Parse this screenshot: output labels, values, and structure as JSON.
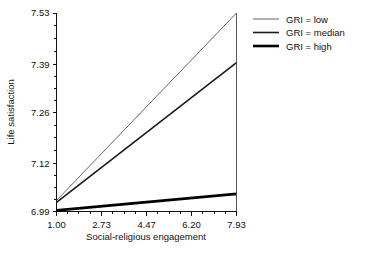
{
  "chart_data": {
    "type": "line",
    "title": "",
    "xlabel": "Social-religious engagement",
    "ylabel": "Life satisfaction",
    "xlim": [
      1.0,
      7.93
    ],
    "ylim": [
      6.99,
      7.53
    ],
    "xticks": [
      "1.00",
      "2.73",
      "4.47",
      "6.20",
      "7.93"
    ],
    "xtick_values": [
      1.0,
      2.73,
      4.47,
      6.2,
      7.93
    ],
    "yticks": [
      "6.99",
      "7.12",
      "7.26",
      "7.39",
      "7.53"
    ],
    "ytick_values": [
      6.99,
      7.12,
      7.26,
      7.39,
      7.53
    ],
    "grid": false,
    "legend_position": "right-top",
    "x": [
      1.0,
      7.93
    ],
    "series": [
      {
        "name": "GRI = low",
        "values": [
          7.02,
          7.53
        ],
        "color": "#555555",
        "linewidth": 0.9
      },
      {
        "name": "GRI = median",
        "values": [
          7.015,
          7.395
        ],
        "color": "#1a1a1a",
        "linewidth": 1.6
      },
      {
        "name": "GRI = high",
        "values": [
          6.993,
          7.038
        ],
        "color": "#000000",
        "linewidth": 2.6
      }
    ]
  },
  "legend": {
    "items": [
      {
        "label": "GRI = low"
      },
      {
        "label": "GRI = median"
      },
      {
        "label": "GRI = high"
      }
    ]
  },
  "axes": {
    "x_title": "Social-religious engagement",
    "y_title": "Life satisfaction",
    "x_tick_labels": [
      "1.00",
      "2.73",
      "4.47",
      "6.20",
      "7.93"
    ],
    "y_tick_labels": [
      "6.99",
      "7.12",
      "7.26",
      "7.39",
      "7.53"
    ]
  }
}
